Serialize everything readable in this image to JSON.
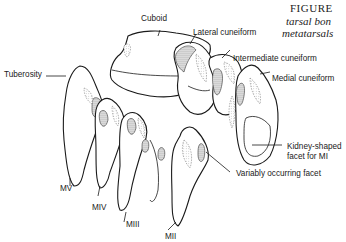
{
  "caption": {
    "line1": "FIGURE",
    "line2": "tarsal bon",
    "line3": "metatarsals"
  },
  "labels": {
    "cuboid": "Cuboid",
    "lateral_cuneiform": "Lateral cuneiform",
    "intermediate_cuneiform": "Intermediate cuneiform",
    "medial_cuneiform": "Medial cuneiform",
    "tuberosity": "Tuberosity",
    "kidney_facet_line1": "Kidney-shaped",
    "kidney_facet_line2": "facet for MI",
    "variable_facet": "Variably occurring facet",
    "mv": "MV",
    "miv": "MIV",
    "miii": "MIII",
    "mii": "MII"
  }
}
